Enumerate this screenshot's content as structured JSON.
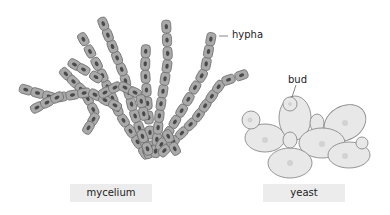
{
  "labels": {
    "hypha": "hypha",
    "bud": "bud"
  },
  "captions": {
    "mycelium": "mycelium",
    "yeast": "yeast"
  },
  "colors": {
    "cell_fill": "#a9a9a9",
    "cell_stroke": "#6f6f6f",
    "nucleus": "#4a4a4a",
    "yeast_fill": "#e8e8e8",
    "yeast_stroke": "#8a8a8a",
    "yeast_nucleus": "#d2d2d2",
    "caption_bg": "#ececec"
  }
}
